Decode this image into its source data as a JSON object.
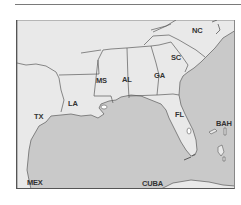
{
  "map": {
    "colors": {
      "land": "#e9e9e9",
      "water": "#c9c9c9",
      "border": "#5a5a5a",
      "frame": "#555555"
    },
    "labels": {
      "nc": "NC",
      "sc": "SC",
      "ms": "MS",
      "al": "AL",
      "ga": "GA",
      "la": "LA",
      "tx": "TX",
      "fl": "FL",
      "bah": "BAH",
      "mex": "MEX",
      "cuba": "CUBA"
    }
  }
}
